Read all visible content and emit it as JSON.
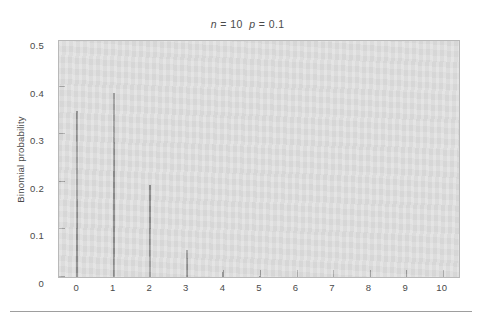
{
  "figure": {
    "title_prefix": "n",
    "title_middle": " = 10  ",
    "title_p": "p",
    "title_suffix": " = 0.1",
    "title_plain": "n = 10  p = 0.1",
    "background_color": "#ffffff",
    "plot_background_color": "#dcdcdc",
    "bar_color": "#8c8c8c",
    "axis_color": "#b9b9b9",
    "text_color": "#4a4a4a"
  },
  "chart_data": {
    "type": "bar",
    "title": "n = 10  p = 0.1",
    "subtitle": "",
    "xlabel": "",
    "ylabel": "Binomial probability",
    "categories": [
      "0",
      "1",
      "2",
      "3",
      "4",
      "5",
      "6",
      "7",
      "8",
      "9",
      "10"
    ],
    "x": [
      0,
      1,
      2,
      3,
      4,
      5,
      6,
      7,
      8,
      9,
      10
    ],
    "values": [
      0.3487,
      0.3874,
      0.1937,
      0.0574,
      0.0112,
      0.0015,
      0.0001,
      0.0,
      0.0,
      0.0,
      0.0
    ],
    "xlim": [
      -0.5,
      10.5
    ],
    "ylim": [
      0,
      0.5
    ],
    "ytick_values": [
      0,
      0.1,
      0.2,
      0.3,
      0.4,
      0.5
    ],
    "ytick_labels": [
      "0",
      "0.1",
      "0.2",
      "0.3",
      "0.4",
      "0.5"
    ],
    "xtick_values": [
      0,
      1,
      2,
      3,
      4,
      5,
      6,
      7,
      8,
      9,
      10
    ],
    "xtick_labels": [
      "0",
      "1",
      "2",
      "3",
      "4",
      "5",
      "6",
      "7",
      "8",
      "9",
      "10"
    ],
    "grid": false,
    "legend": false,
    "legend_position": "none",
    "bar_style": "needle",
    "distribution": "binomial",
    "parameters": {
      "n": 10,
      "p": 0.1
    }
  }
}
